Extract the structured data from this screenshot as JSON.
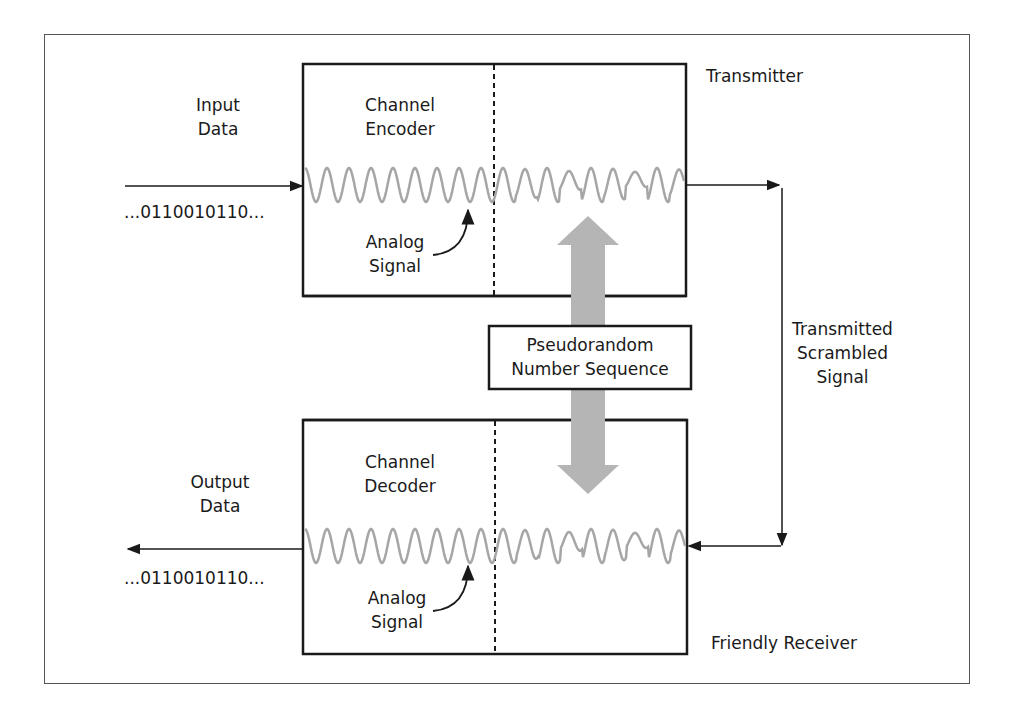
{
  "diagram": {
    "type": "block-diagram",
    "colors": {
      "line": "#1a1a1a",
      "wave": "#a6a6a6",
      "pn_arrow": "#b5b5b5",
      "frame": "#555555",
      "background": "#ffffff"
    },
    "transmitter": {
      "title": "Transmitter",
      "block_label_line1": "Channel",
      "block_label_line2": "Encoder",
      "input_label_line1": "Input",
      "input_label_line2": "Data",
      "input_bits": "...0110010110...",
      "analog_label_line1": "Analog",
      "analog_label_line2": "Signal"
    },
    "receiver": {
      "title": "Friendly Receiver",
      "block_label_line1": "Channel",
      "block_label_line2": "Decoder",
      "output_label_line1": "Output",
      "output_label_line2": "Data",
      "output_bits": "...0110010110...",
      "analog_label_line1": "Analog",
      "analog_label_line2": "Signal"
    },
    "pn_sequence": {
      "label_line1": "Pseudorandom",
      "label_line2": "Number Sequence"
    },
    "channel": {
      "label_line1": "Transmitted",
      "label_line2": "Scrambled",
      "label_line3": "Signal"
    }
  }
}
